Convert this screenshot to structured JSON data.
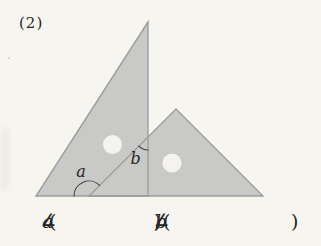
{
  "page": {
    "problem_number": "(2)"
  },
  "figure": {
    "angle_a_label": "a",
    "angle_b_label": "b",
    "colors": {
      "paper": "#f6f5f0",
      "triangle_fill": "#c9c9c8",
      "triangle_edge": "#9d9d9d",
      "hole_fill": "#f4f3ef",
      "arc_stroke": "#3e3e3e",
      "text": "#262626"
    }
  },
  "answer_line": {
    "angle_symbol": "∠",
    "a_var": "a",
    "b_var": "b",
    "open_paren": "(",
    "close_paren": ")",
    "comma": ","
  }
}
